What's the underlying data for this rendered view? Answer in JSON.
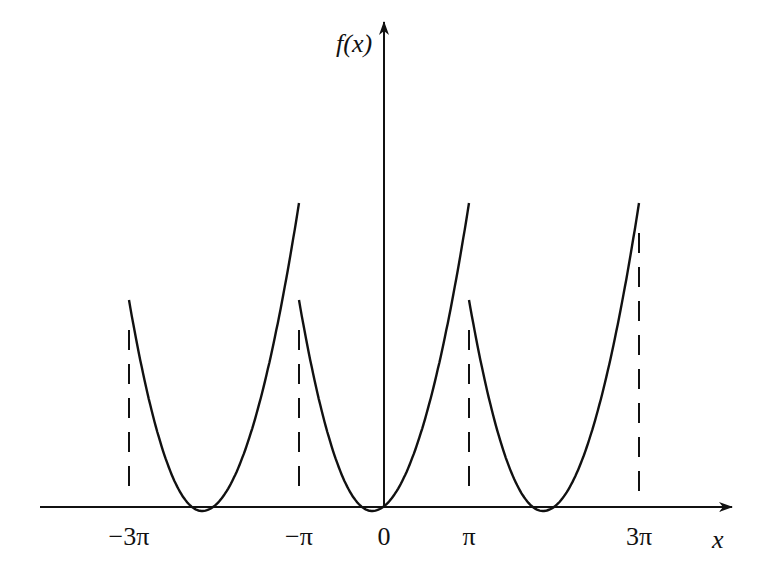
{
  "figure": {
    "ink_color": "#111111",
    "background": "#ffffff"
  },
  "axes": {
    "y_label": "f(x)",
    "x_label": "x",
    "origin_px": [
      384,
      507
    ],
    "pi_px": 85,
    "x_axis_px": {
      "start": 40,
      "end": 732
    },
    "y_axis_px": {
      "top": 22,
      "bottom": 507
    }
  },
  "ticks": [
    {
      "label": "−3π",
      "value": "-3pi",
      "px": 129
    },
    {
      "label": "−π",
      "value": "-pi",
      "px": 299
    },
    {
      "label": "0",
      "value": "0",
      "px": 384
    },
    {
      "label": "π",
      "value": "pi",
      "px": 469
    },
    {
      "label": "3π",
      "value": "3pi",
      "px": 639
    }
  ],
  "curve": {
    "period": "2π",
    "segments": [
      {
        "from": "-3pi",
        "to": "-pi",
        "start_height_px": 207,
        "end_height_px": 304,
        "min_x_px": 202
      },
      {
        "from": "-pi",
        "to": "pi",
        "start_height_px": 207,
        "end_height_px": 304,
        "min_x_px": 372
      },
      {
        "from": "pi",
        "to": "3pi",
        "start_height_px": 207,
        "end_height_px": 304,
        "min_x_px": 543
      }
    ]
  },
  "dashed_guides": [
    {
      "at": "-3pi",
      "px": 129
    },
    {
      "at": "-pi",
      "px": 299
    },
    {
      "at": "pi",
      "px": 469
    },
    {
      "at": "3pi",
      "px": 639
    }
  ]
}
